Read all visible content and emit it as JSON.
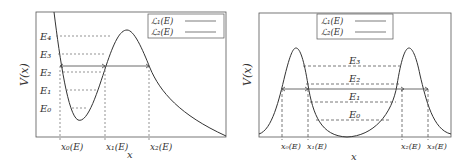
{
  "left_plot": {
    "ylabel": "V(x)",
    "xlabel": "x",
    "legend": [
      "ℒ₁(E)",
      "ℒ₂(E)"
    ],
    "energy_levels": [
      "E₄",
      "E₃",
      "E₂",
      "E₁",
      "E₀"
    ],
    "turning_points": [
      "x₀(E)",
      "x₁(E)",
      "x₂(E)"
    ]
  },
  "right_plot": {
    "ylabel": "V(x)",
    "xlabel": "x",
    "legend": [
      "ℒ₁(E)",
      "ℒ₂(E)"
    ],
    "energy_levels": [
      "E₃",
      "E₂",
      "E₁",
      "E₀"
    ],
    "turning_points": [
      "x₀(E)",
      "x₁(E)",
      "x₂(E)",
      "x₃(E)"
    ]
  },
  "colors": {
    "curve": "#333333",
    "frame": "#555555",
    "dashed": "#666666"
  }
}
